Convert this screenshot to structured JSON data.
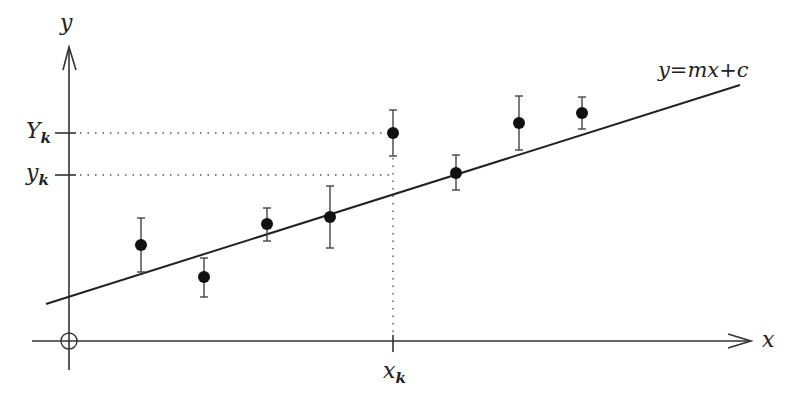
{
  "diagram": {
    "labels": {
      "y_axis": "y",
      "x_axis": "x",
      "origin": "O",
      "line_equation": "y=mx+c",
      "Y_k_main": "Y",
      "Y_k_sub": "k",
      "y_k_main": "y",
      "y_k_sub": "k",
      "x_k_main": "x",
      "x_k_sub": "k"
    },
    "colors": {
      "ink": "#222222",
      "background": "#ffffff"
    }
  },
  "chart_data": {
    "type": "scatter",
    "title": "",
    "xlabel": "x",
    "ylabel": "y",
    "grid": false,
    "fit_line": {
      "label": "y=mx+c",
      "x_start_px": 46,
      "y_start_px": 304,
      "x_end_px": 740,
      "y_end_px": 85
    },
    "points_px": [
      {
        "x": 141,
        "y": 245,
        "err_low": 272,
        "err_high": 218
      },
      {
        "x": 204,
        "y": 277,
        "err_low": 297,
        "err_high": 258
      },
      {
        "x": 267,
        "y": 224,
        "err_low": 241,
        "err_high": 208
      },
      {
        "x": 330,
        "y": 217,
        "err_low": 248,
        "err_high": 186
      },
      {
        "x": 393,
        "y": 133,
        "err_low": 156,
        "err_high": 110
      },
      {
        "x": 456,
        "y": 173,
        "err_low": 190,
        "err_high": 155
      },
      {
        "x": 519,
        "y": 123,
        "err_low": 150,
        "err_high": 96
      },
      {
        "x": 582,
        "y": 113,
        "err_low": 129,
        "err_high": 97
      }
    ],
    "annotations": [
      {
        "text": "Y_k",
        "meaning": "measured value at x_k",
        "y_px": 133
      },
      {
        "text": "y_k",
        "meaning": "fitted value at x_k",
        "y_px": 175
      },
      {
        "text": "x_k",
        "meaning": "k-th abscissa",
        "x_px": 393
      }
    ]
  }
}
